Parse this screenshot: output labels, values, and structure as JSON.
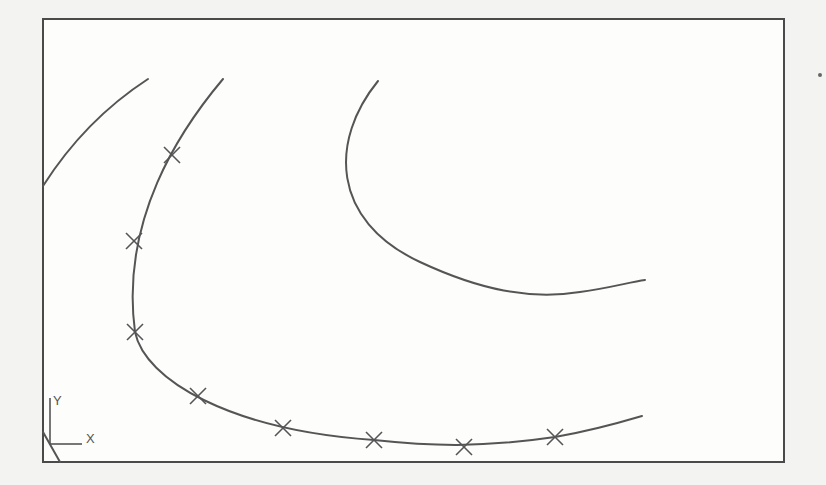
{
  "drawing": {
    "frame": {
      "x": 43,
      "y": 19,
      "width": 741,
      "height": 443
    },
    "ucs_icon": {
      "x_label": "X",
      "y_label": "Y"
    },
    "curves": [
      {
        "id": "left-arc",
        "path": "M 43 186 Q 85 120 148 79"
      },
      {
        "id": "spline-fit-curve",
        "path": "M 223 79 C 180 130 120 220 135 332 C 145 380 230 430 374 440 C 430 446 480 448 555 437 C 590 431 615 424 642 416"
      },
      {
        "id": "upper-right-curve",
        "path": "M 378 81 C 330 140 330 220 420 262 C 480 290 530 300 580 292 C 610 288 630 282 645 280"
      },
      {
        "id": "corner-diagonal",
        "path": "M 43 432 L 60 462"
      }
    ],
    "fit_point_markers": [
      {
        "x": 172,
        "y": 155
      },
      {
        "x": 134,
        "y": 241
      },
      {
        "x": 135,
        "y": 332
      },
      {
        "x": 198,
        "y": 396
      },
      {
        "x": 283,
        "y": 428
      },
      {
        "x": 374,
        "y": 440
      },
      {
        "x": 464,
        "y": 447
      },
      {
        "x": 555,
        "y": 437
      }
    ],
    "stray_dot": {
      "x": 820,
      "y": 75
    }
  },
  "colors": {
    "background": "#f3f3f1",
    "line": "#555555",
    "frame": "#4a4a4a"
  }
}
